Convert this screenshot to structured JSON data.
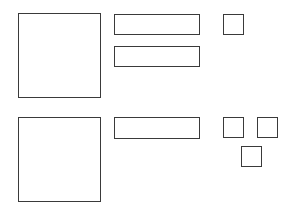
{
  "diagram": {
    "stroke_color": "#3a3a3a",
    "background": "#ffffff",
    "groups": [
      {
        "name": "group-1",
        "shapes": [
          {
            "kind": "large-square",
            "x": 18,
            "y": 13,
            "w": 83,
            "h": 85
          },
          {
            "kind": "bar",
            "x": 114,
            "y": 14,
            "w": 86,
            "h": 21
          },
          {
            "kind": "bar",
            "x": 114,
            "y": 46,
            "w": 86,
            "h": 21
          },
          {
            "kind": "small-square",
            "x": 223,
            "y": 14,
            "w": 21,
            "h": 21
          }
        ]
      },
      {
        "name": "group-2",
        "shapes": [
          {
            "kind": "large-square",
            "x": 18,
            "y": 117,
            "w": 83,
            "h": 85
          },
          {
            "kind": "bar",
            "x": 114,
            "y": 117,
            "w": 86,
            "h": 22
          },
          {
            "kind": "small-square",
            "x": 223,
            "y": 117,
            "w": 21,
            "h": 21
          },
          {
            "kind": "small-square",
            "x": 257,
            "y": 117,
            "w": 21,
            "h": 21
          },
          {
            "kind": "small-square",
            "x": 241,
            "y": 146,
            "w": 21,
            "h": 21
          }
        ]
      }
    ]
  }
}
